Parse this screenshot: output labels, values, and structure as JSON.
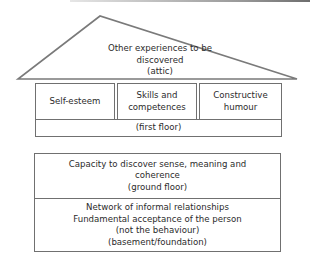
{
  "diagram": {
    "type": "house-metaphor",
    "attic": {
      "lines": [
        "Other experiences to be",
        "discovered",
        "(attic)"
      ]
    },
    "first_floor": {
      "rooms": [
        {
          "lines": [
            "Self-esteem"
          ]
        },
        {
          "lines": [
            "Skills and",
            "competences"
          ]
        },
        {
          "lines": [
            "Constructive",
            "humour"
          ]
        }
      ],
      "label": "(first floor)"
    },
    "ground_floor": {
      "lines": [
        "Capacity to discover sense, meaning and",
        "coherence",
        "(ground floor)"
      ]
    },
    "basement": {
      "lines": [
        "Network of informal relationships",
        "Fundamental acceptance of the person",
        "(not the behaviour)",
        "(basement/foundation)"
      ]
    },
    "colors": {
      "stroke": "#707070",
      "text": "#2b2b2b",
      "background": "#ffffff"
    }
  }
}
